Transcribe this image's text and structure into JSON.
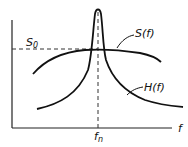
{
  "figure": {
    "type": "diagram",
    "labels": {
      "s0_main": "S",
      "s0_sub": "0",
      "s_curve": "S(f)",
      "h_curve": "H(f)",
      "fn_main": "f",
      "fn_sub": "n",
      "x_axis": "f"
    },
    "colors": {
      "stroke": "#111111",
      "background": "#ffffff"
    }
  }
}
